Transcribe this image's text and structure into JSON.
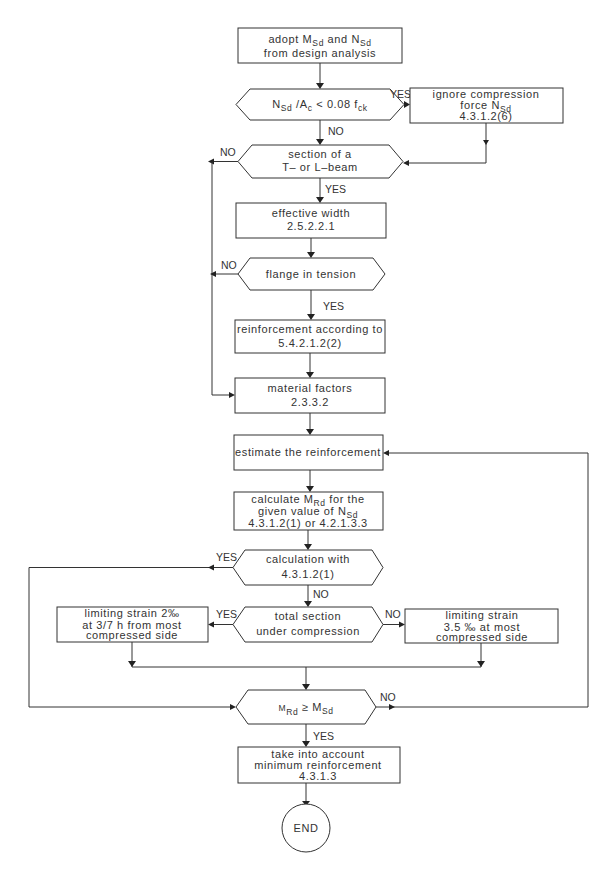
{
  "diagram": {
    "type": "flowchart",
    "nodes": {
      "adopt": {
        "line1_pre": "adopt M",
        "line1_sub1": "Sd",
        "line1_mid": " and N",
        "line1_sub2": "Sd",
        "line2": "from design analysis"
      },
      "check_compression": {
        "n": "N",
        "n_sub": "Sd",
        "mid": " /A",
        "a_sub": "c",
        "rest": " < 0.08 f",
        "f_sub": "ck"
      },
      "ignore_compression": {
        "line1": "ignore compression",
        "line2_pre": "force N",
        "line2_sub": "Sd",
        "line3": "4.3.1.2(6)"
      },
      "section_t_l": {
        "line1": "section of a",
        "line2": "T– or L–beam"
      },
      "effective_width": {
        "line1": "effective width",
        "line2": "2.5.2.2.1"
      },
      "flange_tension": {
        "line1": "flange in tension"
      },
      "reinforcement_according": {
        "line1": "reinforcement according to",
        "line2": "5.4.2.1.2(2)"
      },
      "material_factors": {
        "line1": "material factors",
        "line2": "2.3.3.2"
      },
      "estimate": {
        "line1": "estimate the reinforcement"
      },
      "calculate_mrd": {
        "line1_pre": "calculate M",
        "line1_sub": "Rd",
        "line1_post": " for the",
        "line2_pre": "given value of N",
        "line2_sub": "Sd",
        "line3": "4.3.1.2(1) or 4.2.1.3.3"
      },
      "calculation_with": {
        "line1": "calculation with",
        "line2": "4.3.1.2(1)"
      },
      "total_section": {
        "line1": "total section",
        "line2": "under compression"
      },
      "limiting_2": {
        "line1": "limiting strain 2‰",
        "line2": "at 3/7 h from most",
        "line3": "compressed side"
      },
      "limiting_35": {
        "line1": "limiting strain",
        "line2": "3.5 ‰  at most",
        "line3": "compressed side"
      },
      "mrd_ge_msd": {
        "m1": "M",
        "m1_sub": "Rd",
        "op": " ≥ M",
        "m2_sub": "Sd"
      },
      "minimum_reinforcement": {
        "line1": "take into account",
        "line2": "minimum reinforcement",
        "line3": "4.3.1.3"
      },
      "end": {
        "label": "END"
      }
    },
    "edge_labels": {
      "yes": "YES",
      "no": "NO"
    }
  }
}
